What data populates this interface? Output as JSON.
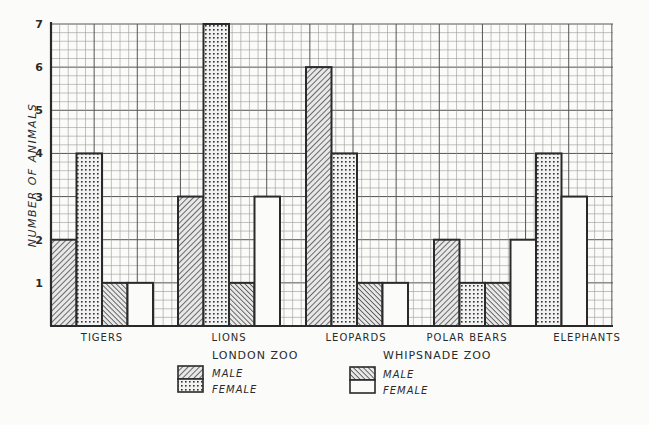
{
  "chart_data": {
    "type": "bar",
    "title": "",
    "xlabel": "",
    "ylabel": "NUMBER OF ANIMALS",
    "ylim": [
      0,
      7
    ],
    "yticks": [
      1,
      2,
      3,
      4,
      5,
      6,
      7
    ],
    "grid": true,
    "categories": [
      "TIGERS",
      "LIONS",
      "LEOPARDS",
      "POLAR BEARS",
      "ELEPHANTS"
    ],
    "series": [
      {
        "name": "London Zoo Male",
        "group": "LONDON ZOO",
        "sex": "MALE",
        "pattern": "diagonal-hatch",
        "values": [
          2,
          3,
          6,
          2,
          0
        ]
      },
      {
        "name": "London Zoo Female",
        "group": "LONDON ZOO",
        "sex": "FEMALE",
        "pattern": "dots",
        "values": [
          4,
          7,
          4,
          1,
          4
        ]
      },
      {
        "name": "Whipsnade Zoo Male",
        "group": "WHIPSNADE ZOO",
        "sex": "MALE",
        "pattern": "reverse-diagonal-hatch",
        "values": [
          1,
          1,
          1,
          1,
          0
        ]
      },
      {
        "name": "Whipsnade Zoo Female",
        "group": "WHIPSNADE ZOO",
        "sex": "FEMALE",
        "pattern": "blank",
        "values": [
          1,
          3,
          1,
          2,
          3
        ]
      }
    ],
    "legend": {
      "position": "bottom",
      "groups": [
        {
          "title": "LONDON ZOO",
          "entries": [
            "MALE",
            "FEMALE"
          ]
        },
        {
          "title": "WHIPSNADE ZOO",
          "entries": [
            "MALE",
            "FEMALE"
          ]
        }
      ]
    }
  },
  "legend": {
    "london_title": "LONDON ZOO",
    "whipsnade_title": "WHIPSNADE ZOO",
    "male": "MALE",
    "female": "FEMALE"
  },
  "colors": {
    "ink": "#2a2a2a",
    "grid_minor": "#8a8a8a",
    "grid_major": "#555555",
    "paper": "#fbfbfa"
  }
}
